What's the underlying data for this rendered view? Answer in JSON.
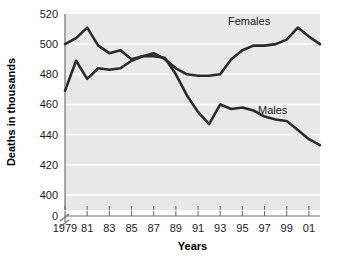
{
  "chart_data": {
    "type": "line",
    "title": "",
    "xlabel": "Years",
    "ylabel": "Deaths in thousands",
    "xlim": [
      1979,
      2002
    ],
    "ylim": [
      390,
      520
    ],
    "grid": true,
    "axis_break": true,
    "axis_break_note": "y-axis broken between 0 and 390",
    "legend_position": "inline-labels",
    "x": [
      1979,
      1980,
      1981,
      1982,
      1983,
      1984,
      1985,
      1986,
      1987,
      1988,
      1989,
      1990,
      1991,
      1992,
      1993,
      1994,
      1995,
      1996,
      1997,
      1998,
      1999,
      2000,
      2001,
      2002
    ],
    "ytick_labels": [
      "0",
      "400",
      "420",
      "440",
      "460",
      "480",
      "500",
      "520"
    ],
    "yticks": [
      400,
      420,
      440,
      460,
      480,
      500,
      520
    ],
    "xtick_labels": [
      "1979",
      "81",
      "83",
      "85",
      "87",
      "89",
      "91",
      "93",
      "95",
      "97",
      "99",
      "01"
    ],
    "xticks": [
      1979,
      1981,
      1983,
      1985,
      1987,
      1989,
      1991,
      1993,
      1995,
      1997,
      1999,
      2001
    ],
    "series": [
      {
        "name": "Females",
        "label": "Females",
        "color": "#2b2b2b",
        "values": [
          500,
          504,
          511,
          499,
          494,
          496,
          490,
          492,
          494,
          490,
          484,
          480,
          479,
          479,
          480,
          490,
          496,
          499,
          499,
          500,
          503,
          511,
          505,
          500
        ]
      },
      {
        "name": "Males",
        "label": "Males",
        "color": "#2b2b2b",
        "values": [
          469,
          489,
          477,
          484,
          483,
          484,
          489,
          492,
          492,
          491,
          480,
          466,
          455,
          447,
          460,
          457,
          458,
          456,
          452,
          450,
          449,
          443,
          437,
          433
        ]
      }
    ]
  },
  "labels": {
    "females": "Females",
    "males": "Males",
    "xlabel": "Years",
    "ylabel": "Deaths in thousands"
  }
}
